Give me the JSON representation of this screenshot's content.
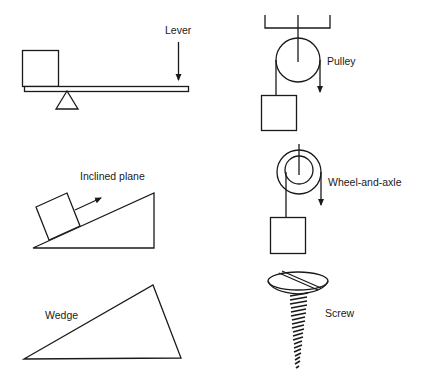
{
  "diagram": {
    "title": "",
    "machines": [
      {
        "id": "lever",
        "label": "Lever"
      },
      {
        "id": "pulley",
        "label": "Pulley"
      },
      {
        "id": "inclined-plane",
        "label": "Inclined plane"
      },
      {
        "id": "wheel-and-axle",
        "label": "Wheel-and-axle"
      },
      {
        "id": "wedge",
        "label": "Wedge"
      },
      {
        "id": "screw",
        "label": "Screw"
      }
    ]
  },
  "colors": {
    "stroke": "#1a1a1a",
    "background": "#ffffff"
  }
}
